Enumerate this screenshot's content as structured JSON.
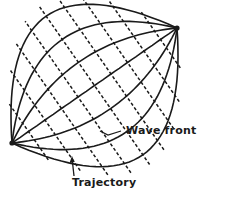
{
  "diagram": {
    "trajectory_count": 7,
    "wavefront_count": 9,
    "colors": {
      "ink": "#1a1a1a",
      "background": "#ffffff"
    },
    "labels": {
      "wave_front": "Wave front",
      "trajectory": "Trajectory"
    }
  }
}
